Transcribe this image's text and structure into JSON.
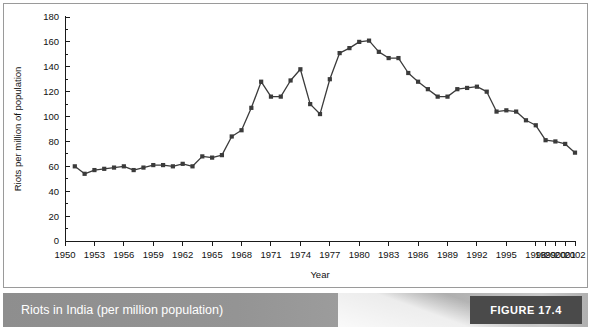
{
  "caption": {
    "text": "Riots in India (per million population)",
    "figure_tag": "FIGURE 17.4"
  },
  "colors": {
    "series": "#3b3b3b",
    "axis": "#1a1a1a",
    "caption_bar": "#949494",
    "figure_tag_block": "#4a4a4a",
    "panel_background": "#ffffff",
    "panel_border": "#9a9a9a"
  },
  "chart_data": {
    "type": "line",
    "title": "",
    "xlabel": "Year",
    "ylabel": "Riots per million of population",
    "ylim": [
      0,
      180
    ],
    "ytick_step": 20,
    "yticks": [
      0,
      20,
      40,
      60,
      80,
      100,
      120,
      140,
      160,
      180
    ],
    "y_minor_step": 10,
    "xlim": [
      1950,
      2002
    ],
    "xtick_labels": [
      "1950",
      "1953",
      "1956",
      "1959",
      "1962",
      "1965",
      "1968",
      "1971",
      "1974",
      "1977",
      "1980",
      "1983",
      "1986",
      "1989",
      "1992",
      "1995",
      "1998",
      "1999",
      "2000",
      "2001",
      "2002"
    ],
    "grid": false,
    "legend": false,
    "marker": "square",
    "x": [
      1951,
      1952,
      1953,
      1954,
      1955,
      1956,
      1957,
      1958,
      1959,
      1960,
      1961,
      1962,
      1963,
      1964,
      1965,
      1966,
      1967,
      1968,
      1969,
      1970,
      1971,
      1972,
      1973,
      1974,
      1975,
      1976,
      1977,
      1978,
      1979,
      1980,
      1981,
      1982,
      1983,
      1984,
      1985,
      1986,
      1987,
      1988,
      1989,
      1990,
      1991,
      1992,
      1993,
      1994,
      1995,
      1996,
      1997,
      1998,
      1999,
      2000,
      2001,
      2002
    ],
    "values": [
      60,
      54,
      57,
      58,
      59,
      60,
      57,
      59,
      61,
      61,
      60,
      62,
      60,
      68,
      67,
      69,
      84,
      89,
      107,
      128,
      116,
      116,
      129,
      138,
      110,
      102,
      130,
      151,
      155,
      160,
      161,
      152,
      147,
      147,
      135,
      128,
      122,
      116,
      116,
      122,
      123,
      124,
      120,
      104,
      105,
      104,
      97,
      93,
      81,
      80,
      78,
      71
    ]
  }
}
